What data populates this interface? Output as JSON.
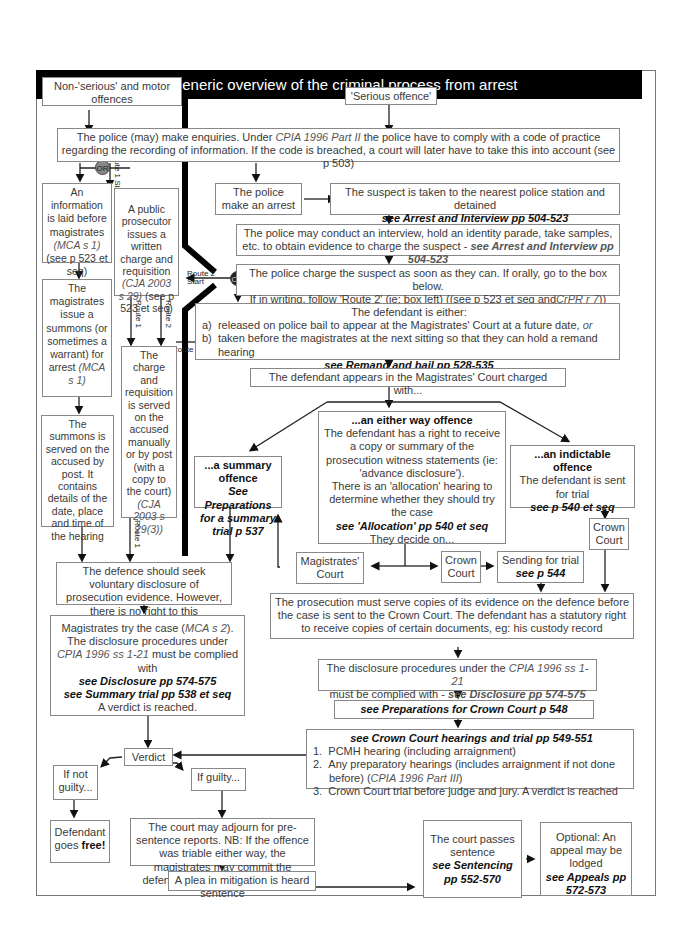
{
  "title": "A generic overview of the criminal process from arrest",
  "left_column": {
    "non_serious": "Non-'serious' and motor offences",
    "or_label": "OR",
    "information": {
      "line1": "An information is laid before magistrates",
      "cite": "(MCA s 1)",
      "line2": "(see p 523 et seq)"
    },
    "summons": {
      "line1": "The magistrates issue a summons (or sometimes a warrant) for arrest",
      "cite": "(MCA s 1)"
    },
    "summons_served": "The summons is served on the accused by post. It contains details of the date, place and time of the hearing"
  },
  "prosecutor_column": {
    "route1_start": "Route 1 Start",
    "public_prosecutor": {
      "line1": "A public prosecutor issues a written charge and requisition",
      "cite": "(CJA 2003 s 29)",
      "line2": "(see p 523 et seq)"
    },
    "route1": "Route 1",
    "route2": "Route 2",
    "charge_served": {
      "line1": "The charge and requisition is served on the accused manually or by post (with a copy to the court)",
      "cite": "(CJA 2003 s 29(3))"
    },
    "route1_bottom": "Route 1"
  },
  "enquiries": {
    "pre": "The police (may) make enquiries. Under",
    "cite": "CPIA 1996 Part II",
    "post": "the police have to comply with a code of practice regarding the recording of information. If the code is breached, a court will later have to take this into account (see p 503)"
  },
  "serious_offence": "'Serious offence'",
  "police_arrest": "The police make an arrest",
  "suspect_taken": {
    "text": "The suspect is taken to the nearest police station and detained",
    "ref": "see Arrest and Interview pp 504-523"
  },
  "interview": {
    "text": "The police may conduct an interview, hold an identity parade, take samples, etc. to obtain evidence to charge the suspect -",
    "ref": "see Arrest and Interview pp 504-523"
  },
  "charge": {
    "line1": "The police charge the suspect as soon as they can. If orally, go to the box below.",
    "line2": "If in writing, follow 'Route 2' (ie: box left) ((see p 523 et seq and",
    "cite": "CrPR r 7",
    "end": "))",
    "route2_start": "Route 2 Start",
    "or_label": "OR"
  },
  "defendant_either": {
    "heading": "The defendant is either:",
    "items": [
      {
        "marker": "a)",
        "text": "released on police bail to appear at the Magistrates' Court at a future date,",
        "suffix": "or"
      },
      {
        "marker": "b)",
        "text": "taken before the magistrates at the next sitting so that they can hold a remand hearing",
        "suffix": ""
      }
    ],
    "ref": "see Remand and bail pp 528-535",
    "route2_label": "Route 2"
  },
  "appears": "The defendant appears in the Magistrates' Court charged with...",
  "summary_offence": {
    "heading": "...a summary offence",
    "ref": "See Preparations for a summary trial p 537"
  },
  "either_way": {
    "heading": "...an either way offence",
    "text1": "The defendant has a right to receive a copy or summary of the prosecution witness statements (ie: 'advance disclosure').",
    "text2": "There is an 'allocation' hearing to determine whether they should try the case",
    "ref": "see 'Allocation' pp 540 et seq",
    "text3": "They decide on..."
  },
  "indictable": {
    "heading": "...an indictable offence",
    "text": "The defendant is sent for trial",
    "ref": "see p 540 et seq"
  },
  "magistrates_court": "Magistrates' Court",
  "crown_court_mid": "Crown Court",
  "crown_court_right": "Crown Court",
  "sending_trial": {
    "text": "Sending for trial",
    "ref": "see p 544"
  },
  "voluntary_disclosure": "The defence should seek voluntary disclosure of prosecution evidence. However, there is no right to this",
  "prosecution_serve": "The prosecution must serve copies of its evidence on the defence before the case is sent to the Crown Court. The defendant has a statutory right to receive copies of certain documents, eg: his custody record",
  "magistrates_try": {
    "pre": "Magistrates try the case (",
    "cite1": "MCA s 2",
    "mid": "). The disclosure procedures under",
    "cite2": "CPIA 1996 ss 1-21",
    "post": "must be complied with",
    "ref1": "see Disclosure pp 574-575",
    "ref2": "see Summary trial pp 538 et seq",
    "end": "A verdict is reached."
  },
  "crown_disclosure": {
    "pre": "The disclosure procedures under the",
    "cite": "CPIA 1996 ss 1-21",
    "post": "must be complied with -",
    "ref": "see Disclosure pp 574-575"
  },
  "prep_crown": "see Preparations for Crown Court p 548",
  "crown_hearings": {
    "heading": "see Crown Court hearings and trial pp 549-551",
    "items": [
      {
        "n": "1.",
        "text": "PCMH hearing (including arraignment)"
      },
      {
        "n": "2.",
        "text": "Any preparatory hearings (includes arraignment if not done before) (",
        "cite": "CPIA 1996 Part III",
        "end": ")"
      },
      {
        "n": "3.",
        "text": "Crown Court trial before judge and jury. A verdict is reached"
      }
    ]
  },
  "verdict": "Verdict",
  "not_guilty": "If not guilty...",
  "guilty": "If guilty...",
  "goes_free": {
    "pre": "Defendant goes",
    "bold": "free!"
  },
  "adjourn": "The court may adjourn for pre-sentence reports. NB: If the offence was triable either way, the magistrates may commit the defendant to the Crown Court for sentence",
  "plea": "A plea in mitigation is heard",
  "sentence": {
    "text": "The court passes sentence",
    "ref": "see Sentencing pp 552-570"
  },
  "appeal": {
    "text": "Optional: An appeal may be lodged",
    "ref": "see Appeals pp 572-573"
  },
  "colors": {
    "title_bg": "#000000",
    "title_fg": "#ffffff",
    "box_border": "#888888",
    "route_line": "#000000",
    "or_circle": "#888888"
  }
}
